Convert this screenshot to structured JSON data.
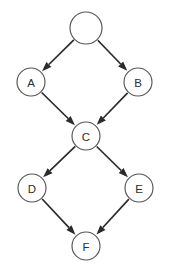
{
  "diagram": {
    "type": "directed-graph",
    "background_color": "#ffffff",
    "node_fill_color": "#ffffff",
    "node_stroke_color": "#555555",
    "edge_color": "#2b2b2b",
    "label_color": "#2e2e2e",
    "width": 170,
    "height": 277,
    "nodes": [
      {
        "id": "root",
        "label": "",
        "cx": 86,
        "cy": 28,
        "r": 16
      },
      {
        "id": "A",
        "label": "A",
        "cx": 31,
        "cy": 82,
        "r": 14
      },
      {
        "id": "B",
        "label": "B",
        "cx": 138,
        "cy": 82,
        "r": 14
      },
      {
        "id": "C",
        "label": "C",
        "cx": 86,
        "cy": 136,
        "r": 14
      },
      {
        "id": "D",
        "label": "D",
        "cx": 32,
        "cy": 188,
        "r": 14
      },
      {
        "id": "E",
        "label": "E",
        "cx": 139,
        "cy": 188,
        "r": 14
      },
      {
        "id": "F",
        "label": "F",
        "cx": 86,
        "cy": 246,
        "r": 14
      }
    ],
    "edges": [
      {
        "from": "root",
        "to": "A",
        "directed": true
      },
      {
        "from": "root",
        "to": "B",
        "directed": true
      },
      {
        "from": "A",
        "to": "C",
        "directed": true
      },
      {
        "from": "B",
        "to": "C",
        "directed": true
      },
      {
        "from": "C",
        "to": "D",
        "directed": true
      },
      {
        "from": "C",
        "to": "E",
        "directed": true
      },
      {
        "from": "D",
        "to": "F",
        "directed": true
      },
      {
        "from": "E",
        "to": "F",
        "directed": true
      }
    ]
  }
}
